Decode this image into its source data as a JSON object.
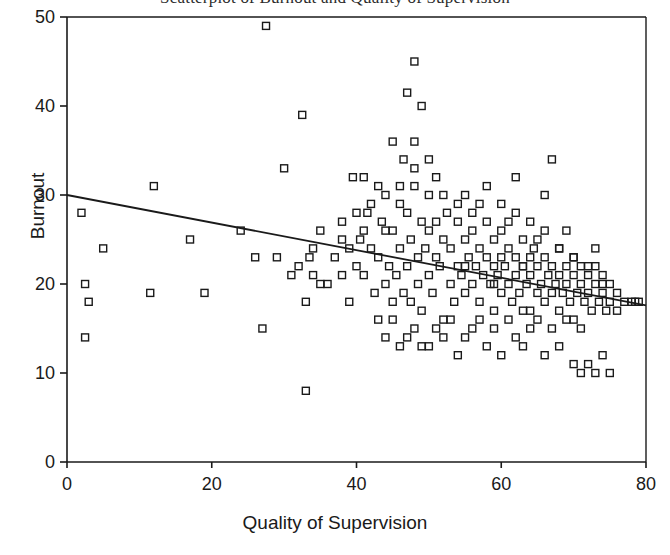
{
  "chart_data": {
    "type": "scatter",
    "title": "Scatterplot of Burnout and Quality of Supervision",
    "xlabel": "Quality of Supervision",
    "ylabel": "Burnout",
    "xlim": [
      0,
      80
    ],
    "ylim": [
      0,
      50
    ],
    "xticks": [
      0,
      20,
      40,
      60,
      80
    ],
    "yticks": [
      0,
      10,
      20,
      30,
      40,
      50
    ],
    "grid": false,
    "legend": null,
    "marker": "open-square",
    "marker_size_px": 7,
    "point_color": "#1a1a1a",
    "line_color": "#1a1a1a",
    "trendline": {
      "type": "linear-regression",
      "x_start": 0,
      "y_start": 30.0,
      "x_end": 80,
      "y_end": 17.6,
      "slope": -0.155,
      "intercept": 30.0
    },
    "n_points": 214,
    "points": [
      [
        2,
        28
      ],
      [
        2.5,
        20
      ],
      [
        3,
        18
      ],
      [
        2.5,
        14
      ],
      [
        5,
        24
      ],
      [
        12,
        31
      ],
      [
        11.5,
        19
      ],
      [
        17,
        25
      ],
      [
        19,
        19
      ],
      [
        24,
        26
      ],
      [
        27.5,
        49
      ],
      [
        26,
        23
      ],
      [
        27,
        15
      ],
      [
        29,
        23
      ],
      [
        31,
        21
      ],
      [
        32,
        22
      ],
      [
        30,
        33
      ],
      [
        32.5,
        39
      ],
      [
        33,
        8
      ],
      [
        33.5,
        23
      ],
      [
        33,
        18
      ],
      [
        34,
        21
      ],
      [
        35,
        20
      ],
      [
        38,
        25
      ],
      [
        39,
        18
      ],
      [
        39.5,
        32
      ],
      [
        40,
        22
      ],
      [
        40.5,
        25
      ],
      [
        41,
        32
      ],
      [
        41,
        21
      ],
      [
        41.5,
        28
      ],
      [
        42,
        24
      ],
      [
        42.5,
        19
      ],
      [
        43,
        23
      ],
      [
        43.5,
        27
      ],
      [
        44,
        20
      ],
      [
        44,
        30
      ],
      [
        44.5,
        22
      ],
      [
        45,
        16
      ],
      [
        45,
        26
      ],
      [
        45.5,
        21
      ],
      [
        46,
        31
      ],
      [
        46,
        24
      ],
      [
        46.5,
        19
      ],
      [
        46.5,
        34
      ],
      [
        47,
        41.5
      ],
      [
        47,
        28
      ],
      [
        47,
        22
      ],
      [
        47.5,
        25
      ],
      [
        47.5,
        18
      ],
      [
        48,
        45
      ],
      [
        48,
        31
      ],
      [
        48,
        36
      ],
      [
        48.5,
        23
      ],
      [
        48.5,
        20
      ],
      [
        49,
        27
      ],
      [
        49,
        40
      ],
      [
        49,
        17
      ],
      [
        49.5,
        24
      ],
      [
        50,
        30
      ],
      [
        50,
        21
      ],
      [
        50,
        26
      ],
      [
        50.5,
        19
      ],
      [
        51,
        23
      ],
      [
        51,
        32
      ],
      [
        51.5,
        22
      ],
      [
        52,
        25
      ],
      [
        52,
        16
      ],
      [
        52.5,
        28
      ],
      [
        53,
        20
      ],
      [
        53,
        24
      ],
      [
        53.5,
        18
      ],
      [
        54,
        22
      ],
      [
        54,
        27
      ],
      [
        54.5,
        21
      ],
      [
        55,
        25
      ],
      [
        55,
        19
      ],
      [
        55,
        30
      ],
      [
        55.5,
        23
      ],
      [
        56,
        20
      ],
      [
        56,
        26
      ],
      [
        56.5,
        22
      ],
      [
        57,
        24
      ],
      [
        57,
        18
      ],
      [
        57.5,
        21
      ],
      [
        58,
        23
      ],
      [
        58,
        27
      ],
      [
        58.5,
        20
      ],
      [
        59,
        22
      ],
      [
        59,
        25
      ],
      [
        59,
        17
      ],
      [
        59.5,
        21
      ],
      [
        60,
        23
      ],
      [
        60,
        19
      ],
      [
        60,
        26
      ],
      [
        60.5,
        22
      ],
      [
        61,
        20
      ],
      [
        61,
        24
      ],
      [
        61.5,
        18
      ],
      [
        62,
        21
      ],
      [
        62,
        23
      ],
      [
        62,
        28
      ],
      [
        62.5,
        19
      ],
      [
        63,
        22
      ],
      [
        63,
        25
      ],
      [
        63.5,
        20
      ],
      [
        64,
        23
      ],
      [
        64,
        17
      ],
      [
        64,
        21
      ],
      [
        64.5,
        24
      ],
      [
        65,
        19
      ],
      [
        65,
        22
      ],
      [
        65.5,
        20
      ],
      [
        66,
        23
      ],
      [
        66,
        18
      ],
      [
        66,
        26
      ],
      [
        66.5,
        21
      ],
      [
        67,
        19
      ],
      [
        67,
        22
      ],
      [
        67.5,
        20
      ],
      [
        68,
        24
      ],
      [
        68,
        17
      ],
      [
        68,
        21
      ],
      [
        68.5,
        19
      ],
      [
        69,
        22
      ],
      [
        69,
        20
      ],
      [
        69.5,
        18
      ],
      [
        70,
        21
      ],
      [
        70,
        23
      ],
      [
        70,
        16
      ],
      [
        70.5,
        19
      ],
      [
        71,
        20
      ],
      [
        71,
        22
      ],
      [
        71.5,
        18
      ],
      [
        72,
        21
      ],
      [
        72,
        19
      ],
      [
        72.5,
        17
      ],
      [
        73,
        20
      ],
      [
        73,
        22
      ],
      [
        73.5,
        18
      ],
      [
        74,
        19
      ],
      [
        74,
        21
      ],
      [
        74.5,
        17
      ],
      [
        75,
        20
      ],
      [
        75,
        18
      ],
      [
        76,
        19
      ],
      [
        78,
        18
      ],
      [
        78.5,
        18
      ],
      [
        79,
        18
      ],
      [
        44,
        14
      ],
      [
        46,
        13
      ],
      [
        48,
        15
      ],
      [
        50,
        13
      ],
      [
        52,
        14
      ],
      [
        54,
        12
      ],
      [
        56,
        15
      ],
      [
        58,
        13
      ],
      [
        60,
        12
      ],
      [
        62,
        14
      ],
      [
        63,
        13
      ],
      [
        64,
        15
      ],
      [
        66,
        12
      ],
      [
        68,
        13
      ],
      [
        70,
        11
      ],
      [
        71,
        10
      ],
      [
        72,
        11
      ],
      [
        73,
        10
      ],
      [
        74,
        12
      ],
      [
        75,
        10
      ],
      [
        36,
        20
      ],
      [
        37,
        23
      ],
      [
        38,
        21
      ],
      [
        35,
        26
      ],
      [
        34,
        24
      ],
      [
        43,
        16
      ],
      [
        45,
        18
      ],
      [
        47,
        14
      ],
      [
        49,
        13
      ],
      [
        51,
        15
      ],
      [
        53,
        16
      ],
      [
        55,
        14
      ],
      [
        57,
        16
      ],
      [
        59,
        15
      ],
      [
        61,
        16
      ],
      [
        63,
        17
      ],
      [
        65,
        16
      ],
      [
        67,
        15
      ],
      [
        69,
        16
      ],
      [
        71,
        15
      ],
      [
        42,
        29
      ],
      [
        44,
        26
      ],
      [
        46,
        29
      ],
      [
        48,
        33
      ],
      [
        50,
        34
      ],
      [
        52,
        30
      ],
      [
        54,
        29
      ],
      [
        56,
        28
      ],
      [
        58,
        31
      ],
      [
        60,
        29
      ],
      [
        62,
        32
      ],
      [
        64,
        27
      ],
      [
        66,
        30
      ],
      [
        68,
        24
      ],
      [
        70,
        23
      ],
      [
        72,
        22
      ],
      [
        73,
        24
      ],
      [
        74,
        20
      ],
      [
        76,
        17
      ],
      [
        77,
        18
      ],
      [
        45,
        36
      ],
      [
        51,
        27
      ],
      [
        57,
        29
      ],
      [
        61,
        27
      ],
      [
        65,
        25
      ],
      [
        40,
        28
      ],
      [
        43,
        31
      ],
      [
        41,
        26
      ],
      [
        39,
        24
      ],
      [
        38,
        27
      ],
      [
        67,
        34
      ],
      [
        69,
        26
      ],
      [
        63,
        22
      ],
      [
        59,
        20
      ],
      [
        55,
        22
      ]
    ]
  },
  "axis": {
    "y_title": "Burnout",
    "x_title": "Quality of Supervision",
    "x_tick_labels": [
      "0",
      "20",
      "40",
      "60",
      "80"
    ],
    "y_tick_labels": [
      "0",
      "10",
      "20",
      "30",
      "40",
      "50"
    ]
  },
  "figure": {
    "title_text": "Scatterplot of Burnout and Quality of Supervision",
    "background": "#ffffff",
    "frame_color": "#1a1a1a"
  }
}
